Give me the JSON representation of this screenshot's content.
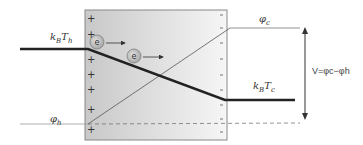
{
  "diagram": {
    "labels": {
      "hot_energy": {
        "main": "k",
        "sub1": "B",
        "main2": "T",
        "sub2": "h"
      },
      "hot_potential": {
        "main": "φ",
        "sub": "h"
      },
      "cold_potential": {
        "main": "φ",
        "sub": "c"
      },
      "cold_energy": {
        "main": "k",
        "sub1": "B",
        "main2": "T",
        "sub2": "c"
      },
      "voltage": "V=φc−φh"
    },
    "electron_label": "e",
    "plus_sign": "+",
    "minus_sign": "-",
    "colors": {
      "box_gradient_left": "#c8c8c8",
      "box_gradient_right": "#f4f4f4",
      "thick_line": "#222222",
      "thin_line": "#555555",
      "electron_fill": "#b8b8b8"
    }
  }
}
